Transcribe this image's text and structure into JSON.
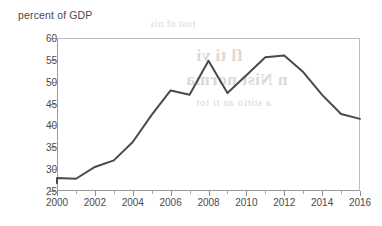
{
  "figure": {
    "caption": "percent of GDP",
    "background_color": "#ffffff",
    "line_color": "#4a4a4a",
    "axis_color": "#9a9a9a",
    "text_color": "#4a4a4a"
  },
  "bleed_through_text": {
    "line1": "fl ti vi",
    "line2": "n Nist norma",
    "line3": "a stitio an   ti tot",
    "line4": "tost of nis"
  },
  "chart_data": {
    "type": "line",
    "title": "",
    "xlabel": "",
    "ylabel": "percent of GDP",
    "ylim": [
      25,
      60
    ],
    "xlim": [
      2000,
      2016
    ],
    "yticks": [
      25,
      30,
      35,
      40,
      45,
      50,
      55,
      60
    ],
    "ytick_labels": [
      "25",
      "30",
      "35",
      "40",
      "45",
      "50",
      "55",
      "60"
    ],
    "xticks": [
      2000,
      2002,
      2004,
      2006,
      2008,
      2010,
      2012,
      2014,
      2016
    ],
    "xtick_labels": [
      "2000",
      "2002",
      "2004",
      "2006",
      "2008",
      "2010",
      "2012",
      "2014",
      "2016"
    ],
    "xticks_minor": [
      2001,
      2003,
      2005,
      2007,
      2009,
      2011,
      2013,
      2015
    ],
    "grid": false,
    "legend": false,
    "legend_position": "none",
    "x": [
      2000,
      2000,
      2001,
      2002,
      2003,
      2004,
      2005,
      2006,
      2007,
      2008,
      2009,
      2010,
      2011,
      2012,
      2013,
      2014,
      2015,
      2016
    ],
    "values": [
      26.8,
      28.0,
      27.8,
      30.5,
      32.0,
      36.2,
      42.4,
      48.0,
      47.0,
      54.8,
      47.4,
      51.5,
      55.6,
      56.0,
      52.2,
      47.0,
      42.6,
      41.5
    ],
    "series": [
      {
        "name": "percent of GDP",
        "color": "#4a4a4a",
        "x": [
          2000,
          2000,
          2001,
          2002,
          2003,
          2004,
          2005,
          2006,
          2007,
          2008,
          2009,
          2010,
          2011,
          2012,
          2013,
          2014,
          2015,
          2016
        ],
        "values": [
          26.8,
          28.0,
          27.8,
          30.5,
          32.0,
          36.2,
          42.4,
          48.0,
          47.0,
          54.8,
          47.4,
          51.5,
          55.6,
          56.0,
          52.2,
          47.0,
          42.6,
          41.5
        ]
      }
    ]
  }
}
